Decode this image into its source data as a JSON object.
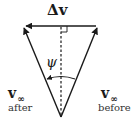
{
  "diagram": {
    "title_label": "Δv",
    "angle_label": "ψ",
    "vectors": [
      {
        "name": "v_inf_after",
        "symbol": "v",
        "subscript": "∞",
        "caption": "after"
      },
      {
        "name": "v_inf_before",
        "symbol": "v",
        "subscript": "∞",
        "caption": "before"
      },
      {
        "name": "delta_v",
        "symbol": "Δv"
      }
    ],
    "labels": {
      "delta_v": "Δv",
      "psi": "ψ",
      "v_after_symbol": "v",
      "v_after_subscript": "∞",
      "v_after_caption": "after",
      "v_before_symbol": "v",
      "v_before_subscript": "∞",
      "v_before_caption": "before"
    },
    "colors": {
      "stroke": "#1a1a1a",
      "background": "#ffffff"
    }
  }
}
